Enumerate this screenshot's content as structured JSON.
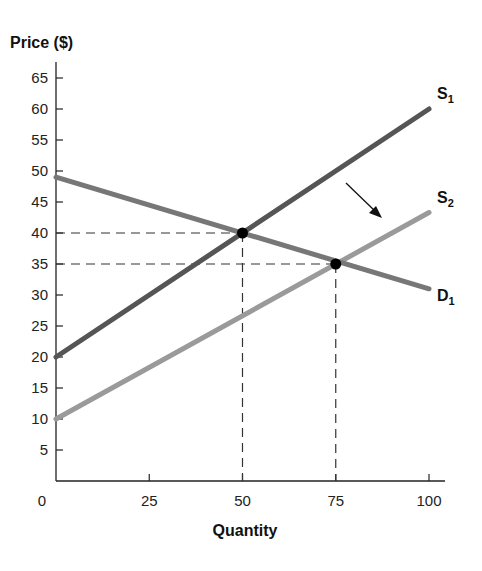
{
  "chart_data": {
    "type": "line",
    "title": "",
    "xlabel": "Quantity",
    "ylabel": "Price ($)",
    "xlim": [
      0,
      100
    ],
    "ylim": [
      0,
      65
    ],
    "x_ticks": [
      0,
      25,
      50,
      75,
      100
    ],
    "y_ticks": [
      5,
      10,
      15,
      20,
      25,
      30,
      35,
      40,
      45,
      50,
      55,
      60,
      65
    ],
    "grid": false,
    "series": [
      {
        "name": "S1",
        "label": "S",
        "sub": "1",
        "color": "#555555",
        "x": [
          0,
          100
        ],
        "y": [
          20,
          60
        ]
      },
      {
        "name": "S2",
        "label": "S",
        "sub": "2",
        "color": "#9a9a9a",
        "x": [
          0,
          100
        ],
        "y": [
          10,
          43.3
        ]
      },
      {
        "name": "D1",
        "label": "D",
        "sub": "1",
        "color": "#777777",
        "x": [
          0,
          100
        ],
        "y": [
          49,
          31
        ]
      }
    ],
    "equilibria": [
      {
        "x": 50,
        "y": 40
      },
      {
        "x": 75,
        "y": 35
      }
    ],
    "annotations": [
      {
        "type": "arrow",
        "description": "supply shift from S1 to S2 (rightward/downward)"
      }
    ]
  }
}
